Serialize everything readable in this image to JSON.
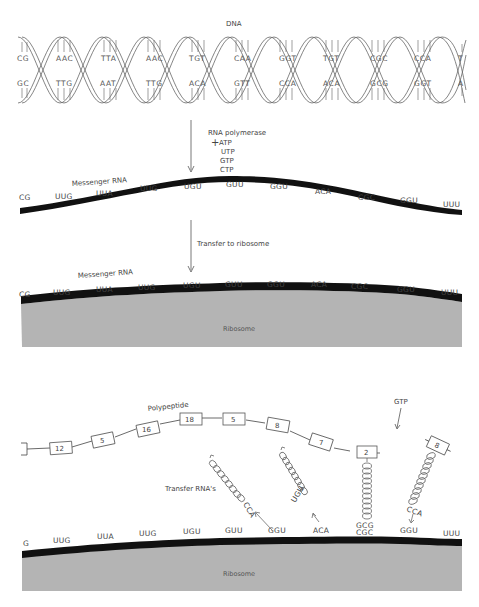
{
  "dna": {
    "title": "DNA",
    "top_strand": [
      "CG",
      "AAC",
      "TTA",
      "AAC",
      "TGT",
      "CAA",
      "GGT",
      "TGT",
      "CGC",
      "CCA",
      "T"
    ],
    "bottom_strand": [
      "GC",
      "TTG",
      "AAT",
      "TTG",
      "ACA",
      "GTT",
      "CCA",
      "ACA",
      "GCG",
      "GGT",
      "A"
    ]
  },
  "transcription": {
    "enzyme_label": "RNA polymerase",
    "plus": "+",
    "nucleotides": [
      "ATP",
      "UTP",
      "GTP",
      "CTP"
    ]
  },
  "mrna1": {
    "label": "Messenger RNA",
    "codons": [
      "CG",
      "UUG",
      "UUA",
      "UUG",
      "UGU",
      "GUU",
      "GGU",
      "ACA",
      "CGC",
      "GGU",
      "UUU"
    ]
  },
  "transfer": {
    "label": "Transfer to ribosome"
  },
  "mrna2": {
    "label": "Messenger RNA",
    "codons": [
      "CG",
      "UUG",
      "UUA",
      "UUG",
      "UGU",
      "GUU",
      "GGU",
      "ACA",
      "CGC",
      "GGU",
      "UUU"
    ],
    "ribosome_label": "Ribosome"
  },
  "translation": {
    "polypeptide_label": "Polypeptide",
    "amino_acids": [
      "12",
      "5",
      "16",
      "18",
      "5",
      "8",
      "7",
      "2"
    ],
    "incoming_amino_acid": "8",
    "gtp_label": "GTP",
    "trna_label": "Transfer RNA's",
    "trna_anticodons": [
      {
        "anticodon": "CCA",
        "released_from": "GGU"
      },
      {
        "anticodon": "UGU",
        "released_from": "ACA"
      },
      {
        "anticodon": "GCG",
        "paired_with": "CGC"
      },
      {
        "anticodon": "CCA",
        "incoming_to": "GGU"
      }
    ],
    "codons": [
      "G",
      "UUG",
      "UUA",
      "UUG",
      "UGU",
      "GUU",
      "GGU",
      "ACA",
      "CGC",
      "GGU",
      "UUU"
    ],
    "ribosome_label": "Ribosome"
  },
  "colors": {
    "mrna_strand": "#111111",
    "ribosome": "#b4b4b4",
    "line": "#555555"
  }
}
